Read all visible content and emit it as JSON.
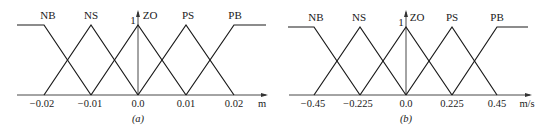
{
  "figure": {
    "panels": [
      {
        "id": "a",
        "caption": "(a)",
        "unit": "m",
        "y_label": "1",
        "sets": [
          "NB",
          "NS",
          "ZO",
          "PS",
          "PB"
        ],
        "ticks": [
          "−0.02",
          "−0.01",
          "0.0",
          "0.01",
          "0.02"
        ],
        "tick_values": [
          -0.02,
          -0.01,
          0.0,
          0.01,
          0.02
        ]
      },
      {
        "id": "b",
        "caption": "(b)",
        "unit": "m/s",
        "y_label": "1",
        "sets": [
          "NB",
          "NS",
          "ZO",
          "PS",
          "PB"
        ],
        "ticks": [
          "−0.45",
          "−0.225",
          "0.0",
          "0.225",
          "0.45"
        ],
        "tick_values": [
          -0.45,
          -0.225,
          0.0,
          0.225,
          0.45
        ]
      }
    ],
    "colors": {
      "line": "#1a1a1a",
      "background": "#ffffff"
    }
  }
}
